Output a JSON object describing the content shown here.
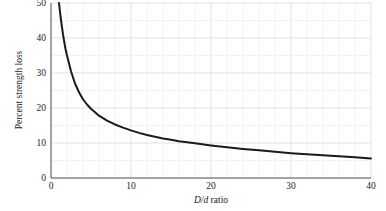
{
  "chart_data": {
    "type": "line",
    "title": "",
    "subtitle": "",
    "xlabel": "D/d ratio",
    "xlabel_parts": {
      "italic1": "D",
      "slash": "/",
      "italic2": "d",
      "roman": " ratio"
    },
    "ylabel": "Percent strength loss",
    "xlim": [
      0,
      40
    ],
    "ylim": [
      0,
      50
    ],
    "xticks": [
      0,
      10,
      20,
      30,
      40
    ],
    "xtick_labels": [
      "0",
      "10",
      "20",
      "30",
      "40"
    ],
    "yticks": [
      0,
      10,
      20,
      30,
      40,
      50
    ],
    "ytick_labels": [
      "0",
      "10",
      "20",
      "30",
      "40",
      "50"
    ],
    "x_minor_step": 2,
    "y_minor_step": 5,
    "grid": true,
    "grid_color": "#e9e9ee",
    "legend": null,
    "line_color": "#1a1a1a",
    "line_width": 2.0,
    "series": [
      {
        "name": "Percent strength loss",
        "x": [
          1.0,
          1.2,
          1.5,
          1.8,
          2.0,
          2.5,
          3.0,
          3.5,
          4.0,
          4.5,
          5.0,
          6.0,
          7.0,
          8.0,
          9.0,
          10.0,
          11.0,
          12.0,
          13.0,
          14.0,
          15.0,
          16.0,
          18.0,
          20.0,
          22.0,
          24.0,
          26.0,
          28.0,
          30.0,
          32.0,
          34.0,
          36.0,
          38.0,
          40.0
        ],
        "values": [
          50.0,
          46.0,
          41.0,
          37.0,
          35.0,
          30.5,
          27.0,
          24.5,
          22.5,
          21.0,
          19.8,
          17.8,
          16.4,
          15.3,
          14.4,
          13.6,
          12.9,
          12.3,
          11.8,
          11.3,
          10.9,
          10.5,
          9.9,
          9.3,
          8.8,
          8.3,
          7.9,
          7.5,
          7.1,
          6.8,
          6.5,
          6.2,
          5.9,
          5.6
        ]
      }
    ]
  },
  "labels": {
    "y_axis_title": "Percent strength loss",
    "x_axis_title": "D/d ratio"
  }
}
